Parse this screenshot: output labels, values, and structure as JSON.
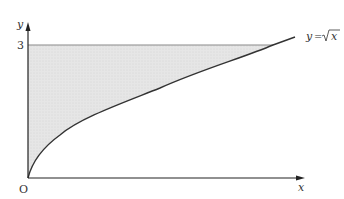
{
  "diagram": {
    "type": "region-under-curve",
    "curve_label": "y = √x",
    "curve_label_parts": {
      "lhs": "y",
      "eq": "=",
      "rad": "x"
    },
    "x_axis_label": "x",
    "y_axis_label": "y",
    "origin_label": "O",
    "y_tick_label": "3",
    "shaded_region": "bounded by y-axis, y = 3, and y = √x",
    "colors": {
      "axis": "#222222",
      "curve": "#333333",
      "shade": "#e4e4e4",
      "boundary_line": "#888888"
    }
  }
}
